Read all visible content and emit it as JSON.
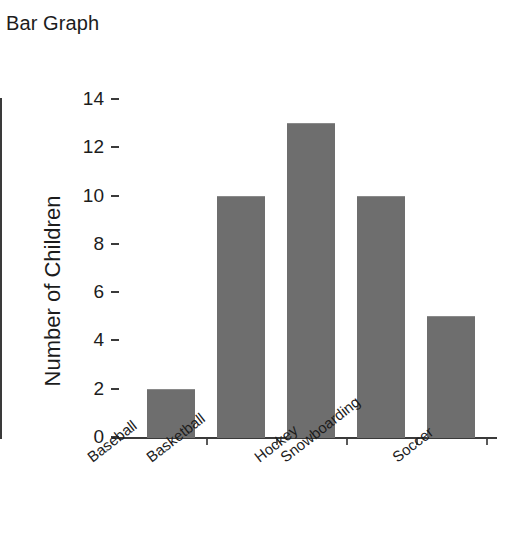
{
  "chart_data": {
    "type": "bar",
    "title": "Bar Graph",
    "xlabel": "",
    "ylabel": "Number of Children",
    "categories": [
      "Baseball",
      "Basketball",
      "Hockey",
      "Snowboarding",
      "Soccer"
    ],
    "values": [
      2,
      10,
      13,
      10,
      5
    ],
    "ylim": [
      0,
      14
    ],
    "ytick_labels": [
      "0",
      "2",
      "4",
      "6",
      "8",
      "10",
      "12",
      "14"
    ],
    "ytick_values": [
      0,
      2,
      4,
      6,
      8,
      10,
      12,
      14
    ],
    "grid": false,
    "legend": null,
    "legend_position": "none",
    "bar_color": "#6e6e6e",
    "axis_color": "#3a3a3a",
    "background_color": "#ffffff",
    "series": [
      {
        "name": "Number of Children",
        "values": [
          2,
          10,
          13,
          10,
          5
        ]
      }
    ]
  }
}
